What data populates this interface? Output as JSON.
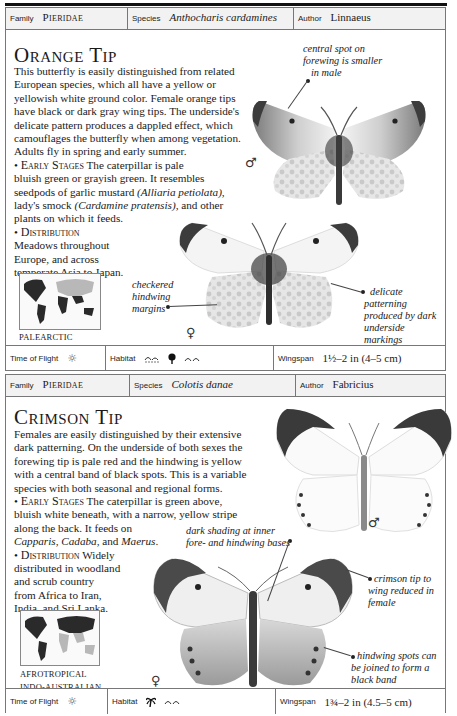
{
  "entries": [
    {
      "header": {
        "family_label": "Family",
        "family": "Pieridae",
        "species_label": "Species",
        "species": "Anthocharis cardamines",
        "author_label": "Author",
        "author": "Linnaeus"
      },
      "title": "Orange Tip",
      "description": [
        "This butterfly is easily distinguished from related",
        "European species, which all have a yellow or",
        "yellowish white ground color. Female orange tips",
        "have black or dark gray wing tips. The underside's",
        "delicate pattern produces a dappled effect, which",
        "camouflages the butterfly when among vegetation.",
        "Adults fly in spring and early summer."
      ],
      "early_stages": {
        "heading": "Early Stages",
        "lines": [
          "The caterpillar is pale",
          "bluish green or grayish green. It resembles",
          "seedpods of garlic mustard ",
          "(Alliaria petiolata),",
          "lady's smock ",
          "(Cardamine pratensis),",
          " and other",
          "plants on which it feeds."
        ]
      },
      "distribution": {
        "heading": "Distribution",
        "lines": [
          "Meadows throughout",
          "Europe, and across",
          "temperate Asia to Japan."
        ]
      },
      "map_region": [
        "PALEARCTIC"
      ],
      "captions": {
        "male_spot": [
          "central spot on",
          "forewing is smaller",
          "in male"
        ],
        "checkered": [
          "checkered",
          "hindwing",
          "margins"
        ],
        "delicate": [
          "delicate",
          "patterning",
          "produced by dark",
          "underside markings",
          "showing through"
        ]
      },
      "sex_symbols": {
        "male": "♂",
        "female": "♀"
      },
      "footer": {
        "time_label": "Time of Flight",
        "time_icon": "sun-icon",
        "habitat_label": "Habitat",
        "habitat_icons": [
          "wetland-icon",
          "tree-icon",
          "grassland-icon"
        ],
        "wingspan_label": "Wingspan",
        "wingspan": "1½–2 in (4–5 cm)"
      }
    },
    {
      "header": {
        "family_label": "Family",
        "family": "Pieridae",
        "species_label": "Species",
        "species": "Colotis danae",
        "author_label": "Author",
        "author": "Fabricius"
      },
      "title": "Crimson Tip",
      "description": [
        "Females are easily distinguished by their extensive",
        "dark patterning. On the underside of both sexes the",
        "forewing tip is pale red and the hindwing is yellow",
        "with a central band of black spots. This is a variable",
        "species with both seasonal and regional forms."
      ],
      "early_stages": {
        "heading": "Early Stages",
        "lines": [
          "The caterpillar is green above,",
          "bluish white beneath, with a narrow, yellow stripe",
          "along the back. It feeds on",
          "Capparis",
          ", ",
          "Cadaba",
          ", and ",
          "Maerus",
          "."
        ]
      },
      "distribution": {
        "heading": "Distribution",
        "lines": [
          "Widely",
          "distributed in woodland",
          "and scrub country",
          "from Africa to Iran,",
          "India, and Sri Lanka."
        ]
      },
      "map_region": [
        "AFROTROPICAL",
        "INDO-AUSTRALIAN"
      ],
      "captions": {
        "dark_shading": [
          "dark shading at inner",
          "fore- and hindwing bases"
        ],
        "crimson_tip": [
          "crimson tip to",
          "wing reduced in",
          "female"
        ],
        "hindwing_spots": [
          "hindwing spots can",
          "be joined to form a",
          "black band"
        ]
      },
      "sex_symbols": {
        "male": "♂",
        "female": "♀"
      },
      "footer": {
        "time_label": "Time of Flight",
        "time_icon": "sun-icon",
        "habitat_label": "Habitat",
        "habitat_icons": [
          "palm-tree-icon",
          "grassland-icon"
        ],
        "wingspan_label": "Wingspan",
        "wingspan": "1¾–2 in (4.5–5 cm)"
      }
    }
  ],
  "colors": {
    "rule": "#111111",
    "header_bg": "#f2f2f2",
    "border": "#777777",
    "map_land_dark": "#2a2a2a",
    "map_land_light": "#b8b8b8"
  }
}
